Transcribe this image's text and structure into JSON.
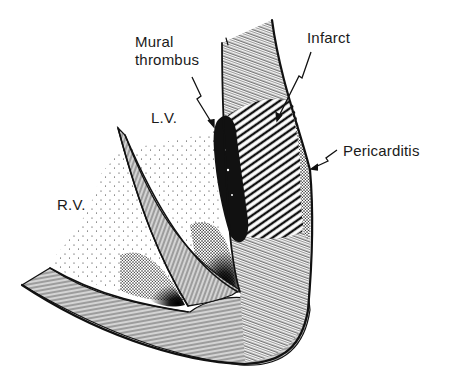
{
  "figure": {
    "colors": {
      "ink": "#111111",
      "paper": "#ffffff"
    }
  },
  "labels": {
    "mural_thrombus": "Mural\nthrombus",
    "infarct": "Infarct",
    "lv": "L.V.",
    "rv": "R.V.",
    "pericarditis": "Pericarditis"
  },
  "regions": [
    {
      "name": "left-ventricle-cavity",
      "label": "L.V."
    },
    {
      "name": "right-ventricle-cavity",
      "label": "R.V."
    },
    {
      "name": "interventricular-septum"
    },
    {
      "name": "lv-free-wall"
    },
    {
      "name": "rv-free-wall"
    },
    {
      "name": "infarct-zone",
      "label": "Infarct",
      "pattern": "diagonal-hatch"
    },
    {
      "name": "mural-thrombus",
      "label": "Mural thrombus",
      "fill": "solid-black"
    },
    {
      "name": "pericardial-surface",
      "label": "Pericarditis",
      "pattern": "stipple"
    }
  ]
}
